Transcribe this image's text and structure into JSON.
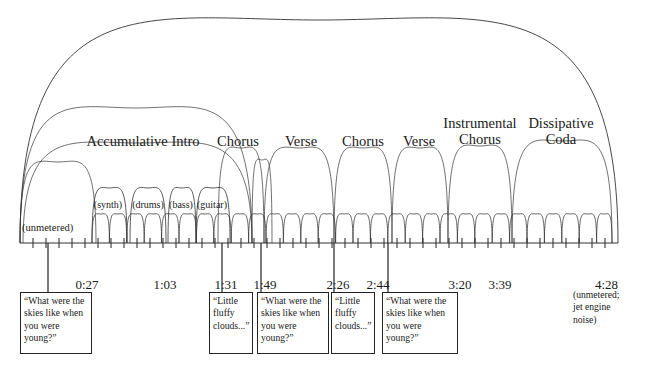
{
  "figure": {
    "kind": "musical-form-arc-diagram",
    "stroke_color": "#333333",
    "background": "#ffffff",
    "axis": {
      "x_start": 20,
      "x_end": 618,
      "y": 243
    }
  },
  "sections": [
    {
      "id": "unmetered",
      "label": "(unmetered)",
      "x": 55,
      "y": 222,
      "align": "left",
      "level": "inline"
    },
    {
      "id": "accumulative-intro",
      "label": "Accumulative Intro",
      "x": 143,
      "y": 134,
      "align": "center",
      "level": "major"
    },
    {
      "id": "chorus-1",
      "label": "Chorus",
      "x": 238,
      "y": 134,
      "align": "center",
      "level": "major"
    },
    {
      "id": "verse-1",
      "label": "Verse",
      "x": 301,
      "y": 134,
      "align": "center",
      "level": "major"
    },
    {
      "id": "chorus-2",
      "label": "Chorus",
      "x": 363,
      "y": 134,
      "align": "center",
      "level": "major"
    },
    {
      "id": "verse-2",
      "label": "Verse",
      "x": 419,
      "y": 134,
      "align": "center",
      "level": "major"
    },
    {
      "id": "instrumental-chorus",
      "label": "Instrumental\nChorus",
      "x": 480,
      "y": 118,
      "align": "center",
      "level": "major"
    },
    {
      "id": "dissipative-coda",
      "label": "Dissipative\nCoda",
      "x": 561,
      "y": 118,
      "align": "center",
      "level": "major"
    }
  ],
  "instruments": [
    {
      "id": "synth",
      "label": "(synth)",
      "x": 108
    },
    {
      "id": "drums",
      "label": "(drums)",
      "x": 148
    },
    {
      "id": "bass",
      "label": "(bass)",
      "x": 181
    },
    {
      "id": "guitar",
      "label": "(guitar)",
      "x": 212
    }
  ],
  "instrument_label_y": 200,
  "timeline": {
    "labels": [
      {
        "id": "t-0027",
        "text": "0:27",
        "x": 87,
        "tick_x": 48
      },
      {
        "id": "t-0103",
        "text": "1:03",
        "x": 165,
        "tick_x": 0
      },
      {
        "id": "t-0131",
        "text": "1:31",
        "x": 226,
        "tick_x": 222
      },
      {
        "id": "t-0149",
        "text": "1:49",
        "x": 265,
        "tick_x": 261
      },
      {
        "id": "t-0226",
        "text": "2:26",
        "x": 338,
        "tick_x": 334
      },
      {
        "id": "t-0244",
        "text": "2:44",
        "x": 378,
        "tick_x": 388
      },
      {
        "id": "t-0320",
        "text": "3:20",
        "x": 460,
        "tick_x": 0
      },
      {
        "id": "t-0339",
        "text": "3:39",
        "x": 500,
        "tick_x": 0
      },
      {
        "id": "t-0428",
        "text": "4:28",
        "x": 618,
        "tick_x": 0
      }
    ],
    "label_y": 278,
    "tick_count": 46
  },
  "lyric_boxes": [
    {
      "id": "lyric-1",
      "text": "“What were the skies like when you were young?”",
      "x": 20,
      "y": 292,
      "w": 72,
      "h": 62
    },
    {
      "id": "lyric-2",
      "text": "“Little fluffy clouds...”",
      "x": 209,
      "y": 292,
      "w": 44,
      "h": 62
    },
    {
      "id": "lyric-3",
      "text": "“What were the skies like when you were young?”",
      "x": 257,
      "y": 292,
      "w": 72,
      "h": 62
    },
    {
      "id": "lyric-4",
      "text": "“Little fluffy clouds...”",
      "x": 331,
      "y": 292,
      "w": 44,
      "h": 62
    },
    {
      "id": "lyric-5",
      "text": "“What were the skies like when you were young?”",
      "x": 382,
      "y": 292,
      "w": 76,
      "h": 62
    }
  ],
  "tail_note": {
    "id": "tail-note",
    "text": "(unmetered;\njet engine\nnoise)",
    "x": 573,
    "y": 289
  },
  "chart_data": {
    "type": "diagram",
    "axis_label": "time",
    "time_markers": [
      "0:27",
      "1:03",
      "1:31",
      "1:49",
      "2:26",
      "2:44",
      "3:20",
      "3:39",
      "4:28"
    ],
    "form_sections": [
      "(unmetered)",
      "Accumulative Intro",
      "Chorus",
      "Verse",
      "Chorus",
      "Verse",
      "Instrumental Chorus",
      "Dissipative Coda"
    ],
    "intro_instruments": [
      "(synth)",
      "(drums)",
      "(bass)",
      "(guitar)"
    ],
    "lyric_cues": [
      "“What were the skies like when you were young?”",
      "“Little fluffy clouds...”",
      "“What were the skies like when you were young?”",
      "“Little fluffy clouds...”",
      "“What were the skies like when you were young?”"
    ],
    "arc_levels": [
      "whole-piece",
      "section",
      "sub-section",
      "phrase"
    ]
  }
}
